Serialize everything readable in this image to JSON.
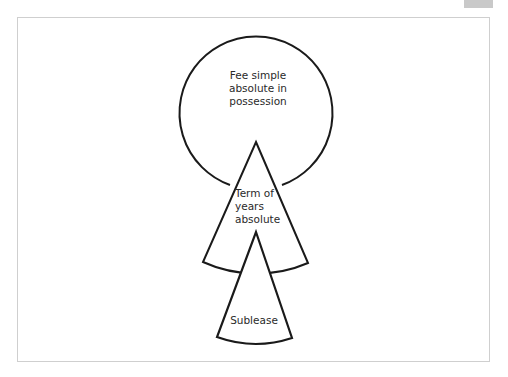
{
  "page_tab": {
    "label": ""
  },
  "diagram": {
    "stroke_color": "#1a1a1a",
    "frame_color": "#cfcfcf",
    "nodes": [
      {
        "id": "fee-simple",
        "shape": "circle",
        "lines": [
          "Fee simple",
          "absolute in",
          "possession"
        ]
      },
      {
        "id": "term-of-years",
        "shape": "sector",
        "lines": [
          "Term of",
          "years",
          "absolute"
        ]
      },
      {
        "id": "sublease",
        "shape": "sector",
        "lines": [
          "Sublease"
        ]
      }
    ],
    "hierarchy": [
      "Fee simple absolute in possession",
      "Term of years absolute",
      "Sublease"
    ]
  }
}
